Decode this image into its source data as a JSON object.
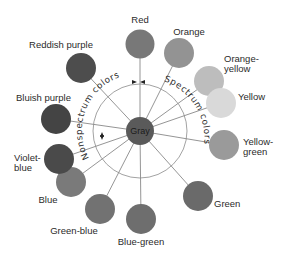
{
  "center": {
    "label": "Gray",
    "x": 140,
    "y": 131,
    "r": 14,
    "color": "#5a5a5a"
  },
  "ring": {
    "r": 47,
    "stroke": "#8a8a8a"
  },
  "arc_labels": {
    "nonspectrum": "Nonspectrum colors",
    "spectrum": "Spectrum colors"
  },
  "colors": [
    {
      "name": "Red",
      "x": 140,
      "y": 44,
      "r": 14.5,
      "fill": "#787878",
      "label": "Red",
      "lx": 140,
      "ly": 23,
      "anchor": "middle",
      "lines": [
        "Red"
      ]
    },
    {
      "name": "Orange",
      "x": 179,
      "y": 53,
      "r": 15,
      "fill": "#939393",
      "label": "Orange",
      "lx": 189,
      "ly": 35,
      "anchor": "middle",
      "lines": [
        "Orange"
      ]
    },
    {
      "name": "Orange-yellow",
      "x": 209,
      "y": 81,
      "r": 15,
      "fill": "#bdbdbd",
      "label": "Orange-yellow",
      "lx": 224,
      "ly": 62,
      "anchor": "start",
      "lines": [
        "Orange-",
        "yellow"
      ]
    },
    {
      "name": "Yellow",
      "x": 221,
      "y": 103,
      "r": 15,
      "fill": "#d9d9d9",
      "label": "Yellow",
      "lx": 238,
      "ly": 100,
      "anchor": "start",
      "lines": [
        "Yellow"
      ]
    },
    {
      "name": "Yellow-green",
      "x": 224,
      "y": 145,
      "r": 15,
      "fill": "#9a9a9a",
      "label": "Yellow-green",
      "lx": 243,
      "ly": 145,
      "anchor": "start",
      "lines": [
        "Yellow-",
        "green"
      ]
    },
    {
      "name": "Green",
      "x": 198,
      "y": 196,
      "r": 15,
      "fill": "#6a6a6a",
      "label": "Green",
      "lx": 214,
      "ly": 207,
      "anchor": "start",
      "lines": [
        "Green"
      ]
    },
    {
      "name": "Blue-green",
      "x": 141,
      "y": 219,
      "r": 15,
      "fill": "#6e6e6e",
      "label": "Blue-green",
      "lx": 141,
      "ly": 245,
      "anchor": "middle",
      "lines": [
        "Blue-green"
      ]
    },
    {
      "name": "Green-blue",
      "x": 100,
      "y": 209,
      "r": 15,
      "fill": "#727272",
      "label": "Green-blue",
      "lx": 74,
      "ly": 234,
      "anchor": "middle",
      "lines": [
        "Green-blue"
      ]
    },
    {
      "name": "Blue",
      "x": 71,
      "y": 182,
      "r": 15,
      "fill": "#7a7a7a",
      "label": "Blue",
      "lx": 48,
      "ly": 203,
      "anchor": "middle",
      "lines": [
        "Blue"
      ]
    },
    {
      "name": "Violet-blue",
      "x": 59,
      "y": 159,
      "r": 15,
      "fill": "#4a4a4a",
      "label": "Violet-blue",
      "lx": 14,
      "ly": 161,
      "anchor": "start",
      "lines": [
        "Violet-",
        "blue"
      ]
    },
    {
      "name": "Bluish purple",
      "x": 56,
      "y": 119,
      "r": 15,
      "fill": "#444444",
      "label": "Bluish purple",
      "lx": 16,
      "ly": 101,
      "anchor": "start",
      "lines": [
        "Bluish purple"
      ]
    },
    {
      "name": "Reddish purple",
      "x": 81,
      "y": 68,
      "r": 15,
      "fill": "#4d4d4d",
      "label": "Reddish purple",
      "lx": 61,
      "ly": 48,
      "anchor": "middle",
      "lines": [
        "Reddish purple"
      ]
    }
  ]
}
